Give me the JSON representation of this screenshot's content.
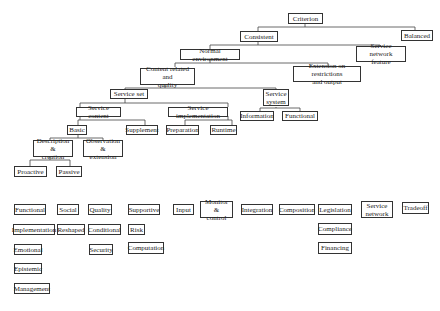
{
  "tree": {
    "criterion": "Criterion",
    "consistent": "Consistent",
    "balanced": "Balanced",
    "normal_environment": "Normal environment",
    "service_network_feature": "Service network\nfeature",
    "content_related_quality": "Content related and\nquality",
    "extension_restrictions": "Extension on restrictions\nand output",
    "service_set": "Service set",
    "service_system": "Service\nsystem",
    "service_content": "Service content",
    "service_implementation": "Service implementation",
    "information": "Information",
    "functional_top": "Functional",
    "basic": "Basic",
    "supplement": "Supplement",
    "preparation": "Preparation",
    "runtime": "Runtime",
    "description_creation": "Description &\ncreation",
    "observation_extension": "Observation &\nextension",
    "proactive": "Proactive",
    "passive": "Passive"
  },
  "grid": {
    "col1": [
      "Functional",
      "Implementation",
      "Emotional",
      "Epistemic",
      "Management"
    ],
    "col2": [
      "Social",
      "Reshaped"
    ],
    "col3": [
      "Quality",
      "Conditional",
      "Security"
    ],
    "col4": [
      "Supportive",
      "Risk",
      "Computation"
    ],
    "col5": [
      "Input"
    ],
    "col6": [
      "Monitor &\ncontrol"
    ],
    "col7": [
      "Integration"
    ],
    "col8": [
      "Composition"
    ],
    "col9": [
      "Legislation",
      "Compliance",
      "Financing"
    ],
    "col10": [
      "Service\nnetwork"
    ],
    "col11": [
      "Tradeoff"
    ]
  }
}
